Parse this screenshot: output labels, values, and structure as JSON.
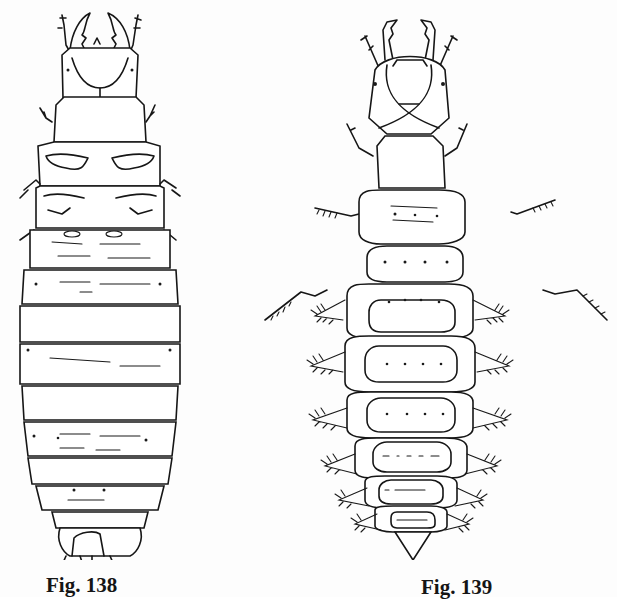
{
  "page": {
    "background": "#fdfdfd",
    "ink_color": "#161616",
    "top_heading_cropped": true
  },
  "figures": [
    {
      "id": "fig138",
      "caption": "Fig. 138",
      "subject": "larva-dorsal-view",
      "description": "Elongate larva line drawing, dorsal view, with head bearing mandibles and antennae, thoracic segments with legs, and segmented abdomen ending in a forked terminal segment"
    },
    {
      "id": "fig139",
      "caption": "Fig. 139",
      "subject": "larva-dorsal-view-with-lateral-processes",
      "description": "Larva line drawing, dorsal view, with large head and hooked mandibles, long spiny legs, and abdominal segments bearing feathery lateral processes, tapering to a pointed tip"
    }
  ]
}
